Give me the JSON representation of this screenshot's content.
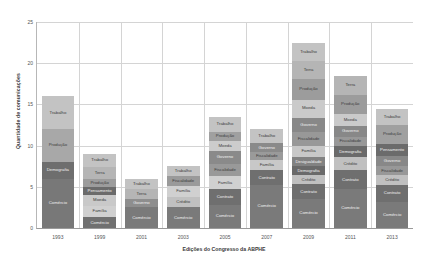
{
  "chart_data": {
    "type": "bar",
    "stacked": true,
    "title": "",
    "xlabel": "Edições do Congresso da ABPHE",
    "ylabel": "Quantidade de comunicações",
    "categories": [
      "1993",
      "1999",
      "2001",
      "2003",
      "2005",
      "2007",
      "2009",
      "2011",
      "2013"
    ],
    "ylim": [
      0,
      25
    ],
    "yticks": [
      0,
      5,
      10,
      15,
      20,
      25
    ],
    "grid": true,
    "legend": "none",
    "stacks": [
      {
        "category": "1993",
        "total": 16,
        "segments": [
          {
            "label": "Trabalho",
            "value": 4,
            "color": "#c3c3c3"
          },
          {
            "label": "Produção",
            "value": 4,
            "color": "#a8a8a8"
          },
          {
            "label": "Demografia",
            "value": 2,
            "color": "#6e6e6e"
          },
          {
            "label": "Comércio",
            "value": 6,
            "color": "#787878"
          }
        ]
      },
      {
        "category": "1999",
        "total": 9,
        "segments": [
          {
            "label": "Trabalho",
            "value": 1.6,
            "color": "#c3c3c3"
          },
          {
            "label": "Terra",
            "value": 1.4,
            "color": "#b5b5b5"
          },
          {
            "label": "Produção",
            "value": 1.0,
            "color": "#9c9c9c"
          },
          {
            "label": "Pensamento",
            "value": 1.0,
            "color": "#6b6b6b"
          },
          {
            "label": "Moeda",
            "value": 1.3,
            "color": "#c9c9c9"
          },
          {
            "label": "Família",
            "value": 1.4,
            "color": "#d0d0d0"
          },
          {
            "label": "Comércio",
            "value": 1.3,
            "color": "#707070"
          }
        ]
      },
      {
        "category": "2001",
        "total": 6,
        "segments": [
          {
            "label": "Trabalho",
            "value": 1.3,
            "color": "#c3c3c3"
          },
          {
            "label": "Terra",
            "value": 1.2,
            "color": "#b5b5b5"
          },
          {
            "label": "Governo",
            "value": 1.0,
            "color": "#8e8e8e"
          },
          {
            "label": "Comércio",
            "value": 2.5,
            "color": "#7a7a7a"
          }
        ]
      },
      {
        "category": "2003",
        "total": 7.5,
        "segments": [
          {
            "label": "Trabalho",
            "value": 1.2,
            "color": "#c3c3c3"
          },
          {
            "label": "Fiscalidade",
            "value": 1.2,
            "color": "#9a9a9a"
          },
          {
            "label": "Família",
            "value": 1.3,
            "color": "#d0d0d0"
          },
          {
            "label": "Crédito",
            "value": 1.3,
            "color": "#c0c0c0"
          },
          {
            "label": "Comércio",
            "value": 2.5,
            "color": "#7a7a7a"
          }
        ]
      },
      {
        "category": "2005",
        "total": 13.5,
        "segments": [
          {
            "label": "Trabalho",
            "value": 1.8,
            "color": "#c3c3c3"
          },
          {
            "label": "Produção",
            "value": 1.1,
            "color": "#a0a0a0"
          },
          {
            "label": "Moeda",
            "value": 1.2,
            "color": "#cccccc"
          },
          {
            "label": "Governo",
            "value": 1.6,
            "color": "#8a8a8a"
          },
          {
            "label": "Fiscalidade",
            "value": 1.5,
            "color": "#999999"
          },
          {
            "label": "Família",
            "value": 1.6,
            "color": "#d0d0d0"
          },
          {
            "label": "Contrato",
            "value": 1.9,
            "color": "#6f6f6f"
          },
          {
            "label": "Comércio",
            "value": 2.8,
            "color": "#7a7a7a"
          }
        ]
      },
      {
        "category": "2007",
        "total": 12,
        "segments": [
          {
            "label": "Trabalho",
            "value": 1.7,
            "color": "#c3c3c3"
          },
          {
            "label": "Governo",
            "value": 1.1,
            "color": "#8a8a8a"
          },
          {
            "label": "Fiscalidade",
            "value": 1.0,
            "color": "#9a9a9a"
          },
          {
            "label": "Família",
            "value": 1.2,
            "color": "#c8c8c8"
          },
          {
            "label": "Contrato",
            "value": 1.8,
            "color": "#6f6f6f"
          },
          {
            "label": "Comércio",
            "value": 5.2,
            "color": "#7a7a7a"
          }
        ]
      },
      {
        "category": "2009",
        "total": 22.5,
        "segments": [
          {
            "label": "Trabalho",
            "value": 2.2,
            "color": "#c3c3c3"
          },
          {
            "label": "Terra",
            "value": 2.2,
            "color": "#b5b5b5"
          },
          {
            "label": "Produção",
            "value": 2.5,
            "color": "#9c9c9c"
          },
          {
            "label": "Moeda",
            "value": 2.2,
            "color": "#cacaca"
          },
          {
            "label": "Governo",
            "value": 1.8,
            "color": "#888888"
          },
          {
            "label": "Fiscalidade",
            "value": 1.6,
            "color": "#989898"
          },
          {
            "label": "Família",
            "value": 1.4,
            "color": "#c8c8c8"
          },
          {
            "label": "Desigualdade",
            "value": 1.1,
            "color": "#828282"
          },
          {
            "label": "Demografia",
            "value": 1.1,
            "color": "#6a6a6a"
          },
          {
            "label": "Crédito",
            "value": 1.1,
            "color": "#c0c0c0"
          },
          {
            "label": "Contrato",
            "value": 1.8,
            "color": "#6f6f6f"
          },
          {
            "label": "Comércio",
            "value": 3.5,
            "color": "#7a7a7a"
          }
        ]
      },
      {
        "category": "2011",
        "total": 18.5,
        "segments": [
          {
            "label": "Terra",
            "value": 2.4,
            "color": "#b5b5b5"
          },
          {
            "label": "Produção",
            "value": 2.2,
            "color": "#9c9c9c"
          },
          {
            "label": "Moeda",
            "value": 1.5,
            "color": "#cacaca"
          },
          {
            "label": "Governo",
            "value": 1.3,
            "color": "#888888"
          },
          {
            "label": "Fiscalidade",
            "value": 1.2,
            "color": "#989898"
          },
          {
            "label": "Demografia",
            "value": 1.3,
            "color": "#6a6a6a"
          },
          {
            "label": "Crédito",
            "value": 1.6,
            "color": "#c0c0c0"
          },
          {
            "label": "Contrato",
            "value": 2.3,
            "color": "#6f6f6f"
          },
          {
            "label": "Comércio",
            "value": 4.7,
            "color": "#7a7a7a"
          }
        ]
      },
      {
        "category": "2013",
        "total": 14.5,
        "segments": [
          {
            "label": "Trabalho",
            "value": 2.0,
            "color": "#c3c3c3"
          },
          {
            "label": "Produção",
            "value": 2.3,
            "color": "#a0a0a0"
          },
          {
            "label": "Pensamento",
            "value": 1.5,
            "color": "#6b6b6b"
          },
          {
            "label": "Governo",
            "value": 1.2,
            "color": "#888888"
          },
          {
            "label": "Fiscalidade",
            "value": 1.1,
            "color": "#989898"
          },
          {
            "label": "Crédito",
            "value": 1.2,
            "color": "#c0c0c0"
          },
          {
            "label": "Contrato",
            "value": 2.0,
            "color": "#6f6f6f"
          },
          {
            "label": "Comércio",
            "value": 3.2,
            "color": "#7a7a7a"
          }
        ]
      }
    ]
  }
}
